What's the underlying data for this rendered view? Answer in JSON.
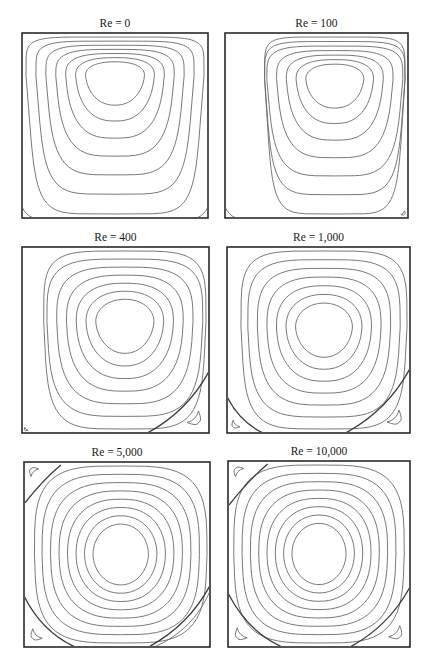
{
  "figure": {
    "panels": [
      {
        "id": "re-0",
        "title": "Re = 0",
        "reynolds": 0,
        "primary_vortex": {
          "center": [
            0.5,
            0.77
          ],
          "contours": 7,
          "shape": "top-heavy"
        },
        "secondary_eddies": [
          {
            "corner": "bottom-left",
            "size": 0.06,
            "closed": false
          },
          {
            "corner": "bottom-right",
            "size": 0.06,
            "closed": false
          }
        ]
      },
      {
        "id": "re-100",
        "title": "Re = 100",
        "reynolds": 100,
        "primary_vortex": {
          "center": [
            0.6,
            0.75
          ],
          "contours": 7,
          "shape": "top-heavy"
        },
        "secondary_eddies": [
          {
            "corner": "bottom-left",
            "size": 0.06,
            "closed": false
          },
          {
            "corner": "bottom-right",
            "size": 0.1,
            "closed": true
          }
        ]
      },
      {
        "id": "re-400",
        "title": "Re = 400",
        "reynolds": 400,
        "primary_vortex": {
          "center": [
            0.55,
            0.6
          ],
          "contours": 7,
          "shape": "rounded"
        },
        "secondary_eddies": [
          {
            "corner": "bottom-left",
            "size": 0.08,
            "closed": true
          },
          {
            "corner": "bottom-right",
            "size": 0.3,
            "closed": true
          }
        ]
      },
      {
        "id": "re-1000",
        "title": "Re = 1,000",
        "reynolds": 1000,
        "primary_vortex": {
          "center": [
            0.53,
            0.57
          ],
          "contours": 7,
          "shape": "rounded"
        },
        "secondary_eddies": [
          {
            "corner": "bottom-left",
            "size": 0.18,
            "closed": true
          },
          {
            "corner": "bottom-right",
            "size": 0.32,
            "closed": true
          }
        ]
      },
      {
        "id": "re-5000",
        "title": "Re = 5,000",
        "reynolds": 5000,
        "primary_vortex": {
          "center": [
            0.52,
            0.5
          ],
          "contours": 8,
          "shape": "circular"
        },
        "secondary_eddies": [
          {
            "corner": "top-left",
            "size": 0.2,
            "closed": true
          },
          {
            "corner": "bottom-left",
            "size": 0.25,
            "closed": true
          },
          {
            "corner": "bottom-right",
            "size": 0.3,
            "closed": false
          }
        ]
      },
      {
        "id": "re-10000",
        "title": "Re = 10,000",
        "reynolds": 10000,
        "primary_vortex": {
          "center": [
            0.5,
            0.5
          ],
          "contours": 8,
          "shape": "circular"
        },
        "secondary_eddies": [
          {
            "corner": "top-left",
            "size": 0.22,
            "closed": true
          },
          {
            "corner": "bottom-left",
            "size": 0.27,
            "closed": true
          },
          {
            "corner": "bottom-right",
            "size": 0.3,
            "closed": true
          }
        ]
      }
    ]
  }
}
